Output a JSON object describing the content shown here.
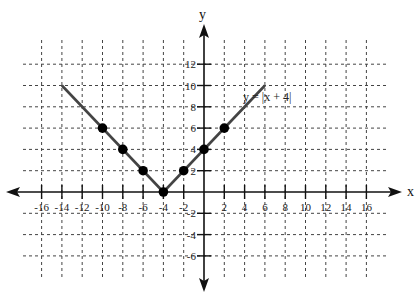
{
  "chart_data": {
    "type": "line",
    "title": "",
    "equation_label": "y = |x + 4|",
    "xlabel": "x",
    "ylabel": "y",
    "xlim": [
      -18,
      18
    ],
    "ylim": [
      -8,
      14
    ],
    "grid": true,
    "x_ticks": [
      -16,
      -14,
      -12,
      -10,
      -8,
      -6,
      -4,
      -2,
      2,
      4,
      6,
      8,
      10,
      12,
      14,
      16
    ],
    "y_ticks": [
      12,
      10,
      8,
      6,
      4,
      2,
      -2,
      -4,
      -6
    ],
    "series": [
      {
        "name": "y = |x + 4|",
        "x": [
          -14,
          -4,
          6
        ],
        "y": [
          10,
          0,
          10
        ]
      }
    ],
    "points": [
      {
        "x": -10,
        "y": 6
      },
      {
        "x": -8,
        "y": 4
      },
      {
        "x": -6,
        "y": 2
      },
      {
        "x": -4,
        "y": 0
      },
      {
        "x": -2,
        "y": 2
      },
      {
        "x": 0,
        "y": 4
      },
      {
        "x": 2,
        "y": 6
      }
    ]
  }
}
